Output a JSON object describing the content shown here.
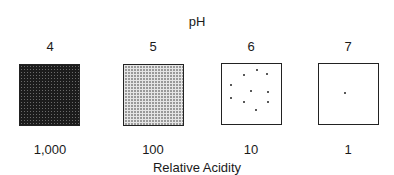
{
  "diagram": {
    "title": "pH",
    "xlabel": "Relative Acidity",
    "columns": [
      {
        "ph": "4",
        "relative_acidity": "1,000",
        "fill": "dense-dark"
      },
      {
        "ph": "5",
        "relative_acidity": "100",
        "fill": "grid-gray"
      },
      {
        "ph": "6",
        "relative_acidity": "10",
        "fill": "ten-dots"
      },
      {
        "ph": "7",
        "relative_acidity": "1",
        "fill": "one-dot"
      }
    ]
  }
}
